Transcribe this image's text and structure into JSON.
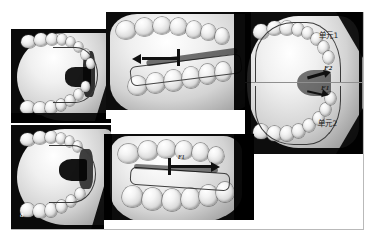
{
  "figure": {
    "sublabel": "a",
    "panels": [
      {
        "id": "top-left",
        "name": "upper-arch-occlusal-view",
        "view": "occlusal",
        "labels": []
      },
      {
        "id": "top-center",
        "name": "lateral-view-with-retraction-arrow",
        "view": "lateral",
        "labels": []
      },
      {
        "id": "right",
        "name": "occlusal-view-with-force-units",
        "view": "occlusal",
        "labels": [
          "单元1",
          "F2",
          "F1",
          "单元2"
        ]
      },
      {
        "id": "bottom-left",
        "name": "lower-arch-occlusal-view",
        "view": "occlusal",
        "labels": [
          "a"
        ]
      },
      {
        "id": "bottom-center",
        "name": "lateral-view-with-protraction-arrow",
        "view": "lateral",
        "labels": [
          "F1"
        ]
      }
    ]
  },
  "annotations": {
    "unit1": "单元1",
    "unit2": "单元2",
    "force1": "F1",
    "force2": "F2",
    "force1_small": "F1",
    "subfigure": "a"
  },
  "colors": {
    "panel_background": "#000000",
    "cast_light": "#ffffff",
    "cast_mid": "#d3d3d3",
    "cast_shadow": "#8a8a8a",
    "annotation_text": "#1a1a1a",
    "sublabel_text": "#ffffff",
    "arrow": "#101010",
    "guide_line": "#8f8f8f",
    "figure_border": "#b9b9b9"
  }
}
